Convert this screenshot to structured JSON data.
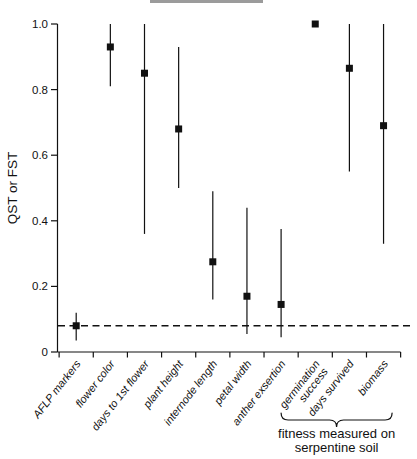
{
  "figure": {
    "background_color": "#ffffff",
    "foreground_color": "#111111",
    "has_cropped_title_remnant_bar": true
  },
  "chart_data": {
    "type": "scatter",
    "title": "",
    "xlabel": "",
    "ylabel": "QST or FST",
    "ylim": [
      0,
      1.0
    ],
    "yticks": [
      0,
      0.2,
      0.4,
      0.6,
      0.8,
      1.0
    ],
    "ytick_labels": [
      "0",
      "0.2",
      "0.4",
      "0.6",
      "0.8",
      "1.0"
    ],
    "grid": false,
    "legend": "none",
    "baseline": {
      "value": 0.08,
      "style": "dashed",
      "color": "#111111"
    },
    "marker": {
      "shape": "square",
      "color": "#111111",
      "size": 7
    },
    "categories": [
      "AFLP markers",
      "flower color",
      "days to 1st flower",
      "plant height",
      "internode length",
      "petal width",
      "anther exsertion",
      "germination\nsuccess",
      "days survived",
      "biomass"
    ],
    "series": [
      {
        "name": "QST or FST point estimates with confidence intervals",
        "points": [
          {
            "category": "AFLP markers",
            "value": 0.08,
            "ci_low": 0.035,
            "ci_high": 0.12
          },
          {
            "category": "flower color",
            "value": 0.93,
            "ci_low": 0.81,
            "ci_high": 1.0
          },
          {
            "category": "days to 1st flower",
            "value": 0.85,
            "ci_low": 0.36,
            "ci_high": 1.0
          },
          {
            "category": "plant height",
            "value": 0.68,
            "ci_low": 0.5,
            "ci_high": 0.93
          },
          {
            "category": "internode length",
            "value": 0.275,
            "ci_low": 0.16,
            "ci_high": 0.49
          },
          {
            "category": "petal width",
            "value": 0.17,
            "ci_low": 0.055,
            "ci_high": 0.44
          },
          {
            "category": "anther exsertion",
            "value": 0.145,
            "ci_low": 0.045,
            "ci_high": 0.375
          },
          {
            "category": "germination\nsuccess",
            "value": 1.0,
            "ci_low": null,
            "ci_high": null
          },
          {
            "category": "days survived",
            "value": 0.865,
            "ci_low": 0.55,
            "ci_high": 1.0
          },
          {
            "category": "biomass",
            "value": 0.69,
            "ci_low": 0.33,
            "ci_high": 1.0
          }
        ]
      }
    ],
    "annotations": [
      {
        "type": "underbrace",
        "category_start": 7,
        "category_end": 9,
        "label": "fitness measured on\nserpentine soil"
      }
    ]
  }
}
